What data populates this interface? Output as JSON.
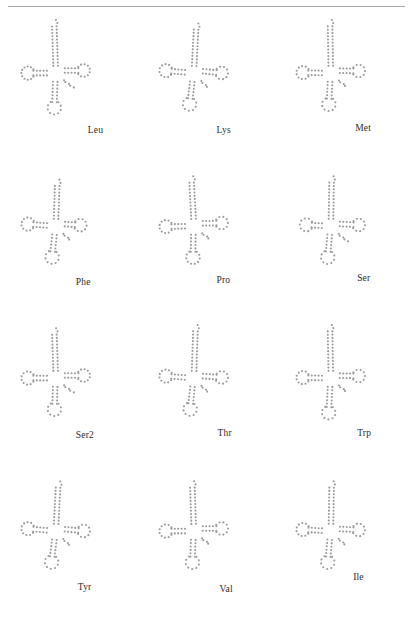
{
  "figure": {
    "kind": "trna-cloverleaf-grid",
    "rows": 4,
    "columns": 3,
    "dot_color": "#9a9a9a",
    "rule_color": "#a8a8a8",
    "background": "#ffffff",
    "label_color": "#2b2b2b"
  },
  "panels": [
    {
      "label": "Leu",
      "label_x": 88,
      "label_y": 112,
      "acceptor_len": 13,
      "d_loop_n": 11,
      "anticodon_loop_n": 9,
      "t_loop_n": 10,
      "d_stem_len": 5,
      "anticodon_stem_len": 7,
      "t_stem_len": 5,
      "variable_len": 5,
      "rotation": -2
    },
    {
      "label": "Lys",
      "label_x": 79,
      "label_y": 112,
      "acceptor_len": 12,
      "d_loop_n": 10,
      "anticodon_loop_n": 9,
      "t_loop_n": 9,
      "d_stem_len": 5,
      "anticodon_stem_len": 6,
      "t_stem_len": 5,
      "variable_len": 4,
      "rotation": 3
    },
    {
      "label": "Met",
      "label_x": 80,
      "label_y": 110,
      "acceptor_len": 13,
      "d_loop_n": 10,
      "anticodon_loop_n": 9,
      "t_loop_n": 9,
      "d_stem_len": 5,
      "anticodon_stem_len": 6,
      "t_stem_len": 5,
      "variable_len": 4,
      "rotation": -1
    },
    {
      "label": "Phe",
      "label_x": 76,
      "label_y": 112,
      "acceptor_len": 11,
      "d_loop_n": 10,
      "anticodon_loop_n": 9,
      "t_loop_n": 9,
      "d_stem_len": 5,
      "anticodon_stem_len": 6,
      "t_stem_len": 4,
      "variable_len": 4,
      "rotation": 2
    },
    {
      "label": "Pro",
      "label_x": 79,
      "label_y": 110,
      "acceptor_len": 12,
      "d_loop_n": 10,
      "anticodon_loop_n": 10,
      "t_loop_n": 9,
      "d_stem_len": 5,
      "anticodon_stem_len": 6,
      "t_stem_len": 5,
      "variable_len": 4,
      "rotation": -3
    },
    {
      "label": "Ser",
      "label_x": 82,
      "label_y": 108,
      "acceptor_len": 12,
      "d_loop_n": 9,
      "anticodon_loop_n": 9,
      "t_loop_n": 9,
      "d_stem_len": 4,
      "anticodon_stem_len": 6,
      "t_stem_len": 5,
      "variable_len": 5,
      "rotation": 1
    },
    {
      "label": "Ser2",
      "label_x": 76,
      "label_y": 112,
      "acceptor_len": 12,
      "d_loop_n": 10,
      "anticodon_loop_n": 9,
      "t_loop_n": 10,
      "d_stem_len": 5,
      "anticodon_stem_len": 6,
      "t_stem_len": 5,
      "variable_len": 5,
      "rotation": -2
    },
    {
      "label": "Thr",
      "label_x": 80,
      "label_y": 110,
      "acceptor_len": 13,
      "d_loop_n": 10,
      "anticodon_loop_n": 9,
      "t_loop_n": 9,
      "d_stem_len": 5,
      "anticodon_stem_len": 6,
      "t_stem_len": 5,
      "variable_len": 4,
      "rotation": 2
    },
    {
      "label": "Trp",
      "label_x": 82,
      "label_y": 110,
      "acceptor_len": 13,
      "d_loop_n": 10,
      "anticodon_loop_n": 9,
      "t_loop_n": 9,
      "d_stem_len": 5,
      "anticodon_stem_len": 7,
      "t_stem_len": 5,
      "variable_len": 4,
      "rotation": -1
    },
    {
      "label": "Tyr",
      "label_x": 78,
      "label_y": 112,
      "acceptor_len": 12,
      "d_loop_n": 10,
      "anticodon_loop_n": 9,
      "t_loop_n": 9,
      "d_stem_len": 5,
      "anticodon_stem_len": 6,
      "t_stem_len": 5,
      "variable_len": 4,
      "rotation": 3
    },
    {
      "label": "Val",
      "label_x": 82,
      "label_y": 114,
      "acceptor_len": 12,
      "d_loop_n": 10,
      "anticodon_loop_n": 9,
      "t_loop_n": 9,
      "d_stem_len": 5,
      "anticodon_stem_len": 6,
      "t_stem_len": 5,
      "variable_len": 4,
      "rotation": -2
    },
    {
      "label": "Ile",
      "label_x": 78,
      "label_y": 102,
      "acceptor_len": 12,
      "d_loop_n": 10,
      "anticodon_loop_n": 9,
      "t_loop_n": 9,
      "d_stem_len": 5,
      "anticodon_stem_len": 6,
      "t_stem_len": 5,
      "variable_len": 4,
      "rotation": 1
    }
  ]
}
